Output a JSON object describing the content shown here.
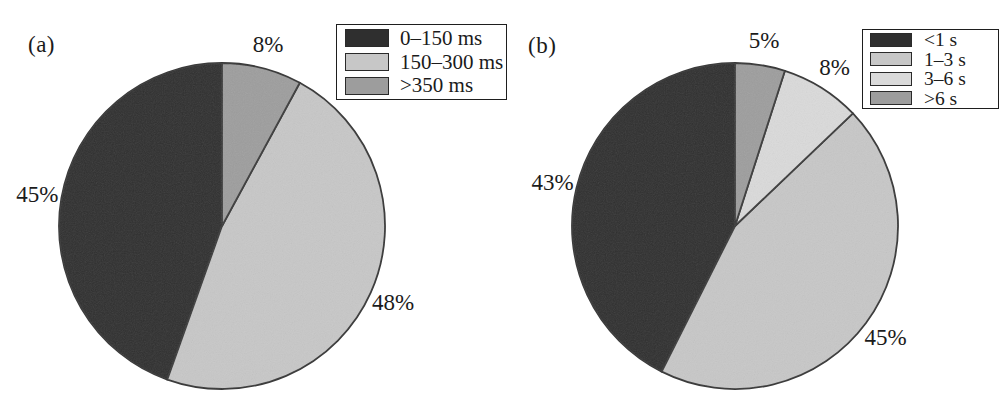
{
  "figure": {
    "background_color": "#ffffff",
    "text_color": "#1b1b1b",
    "slice_border_color": "#3a3a3a",
    "legend_border_color": "#1e1e1e"
  },
  "chart_data": [
    {
      "type": "pie",
      "panel_label": "(a)",
      "slices": [
        {
          "label": "0–150 ms",
          "value": 45,
          "pct_label": "45%",
          "color": "#2f2f2f"
        },
        {
          "label": "150–300 ms",
          "value": 48,
          "pct_label": "48%",
          "color": "#c7c7c7"
        },
        {
          "label": ">350 ms",
          "value": 8,
          "pct_label": "8%",
          "color": "#9d9d9d"
        }
      ],
      "layout": {
        "start_angle": "12-oclock",
        "direction": "counterclockwise-in-legend-order",
        "legend_position": "upper-right",
        "labels": "outside",
        "slice_border_color": "#3a3a3a"
      }
    },
    {
      "type": "pie",
      "panel_label": "(b)",
      "slices": [
        {
          "label": "<1 s",
          "value": 43,
          "pct_label": "43%",
          "color": "#2f2f2f"
        },
        {
          "label": "1–3 s",
          "value": 45,
          "pct_label": "45%",
          "color": "#c7c7c7"
        },
        {
          "label": "3–6 s",
          "value": 8,
          "pct_label": "8%",
          "color": "#dadada"
        },
        {
          "label": ">6 s",
          "value": 5,
          "pct_label": "5%",
          "color": "#9d9d9d"
        }
      ],
      "layout": {
        "start_angle": "12-oclock",
        "direction": "counterclockwise-in-legend-order",
        "legend_position": "upper-right",
        "labels": "outside",
        "slice_border_color": "#3a3a3a"
      }
    }
  ]
}
